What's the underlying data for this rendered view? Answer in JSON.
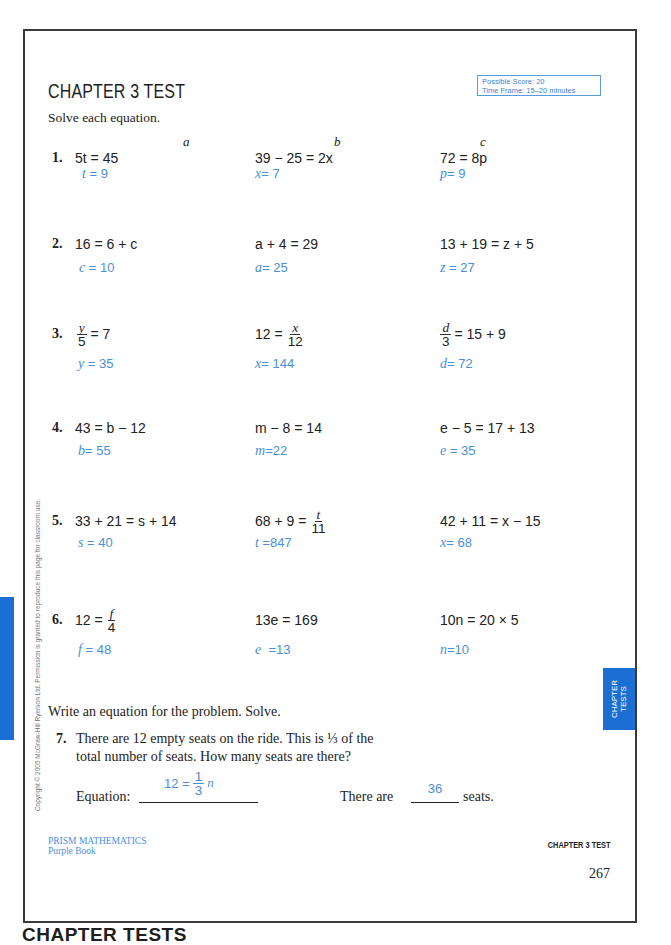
{
  "header": {
    "title": "CHAPTER 3 TEST",
    "score_box": {
      "possible_score": "Possible Score: 20",
      "time_frame": "Time Frame: 15–20 minutes"
    }
  },
  "instructions": "Solve each equation.",
  "column_labels": [
    "a",
    "b",
    "c"
  ],
  "rows": [
    {
      "number": "1.",
      "cells": [
        {
          "eq": {
            "pre": "5t = 45"
          },
          "answer": {
            "var": "t",
            "rest": " = 9"
          }
        },
        {
          "eq": {
            "pre": "39 − 25 = 2x"
          },
          "answer": {
            "var": "x",
            "rest": "= 7"
          }
        },
        {
          "eq": {
            "pre": "72 = 8p"
          },
          "answer": {
            "var": "p",
            "rest": "= 9"
          }
        }
      ]
    },
    {
      "number": "2.",
      "cells": [
        {
          "eq": {
            "pre": "16 = 6 + c"
          },
          "answer": {
            "var": "c",
            "rest": " = 10"
          }
        },
        {
          "eq": {
            "pre": "a + 4 = 29"
          },
          "answer": {
            "var": "a",
            "rest": "= 25"
          }
        },
        {
          "eq": {
            "pre": "13 + 19 = z + 5"
          },
          "answer": {
            "var": "z",
            "rest": " = 27"
          }
        }
      ]
    },
    {
      "number": "3.",
      "cells": [
        {
          "eq": {
            "pre": "",
            "num": "y",
            "den": "5",
            "post": "= 7"
          },
          "answer": {
            "var": "y",
            "rest": " = 35"
          }
        },
        {
          "eq": {
            "pre": "12 =",
            "num": "x",
            "den": "12",
            "post": ""
          },
          "answer": {
            "var": "x",
            "rest": "= 144"
          }
        },
        {
          "eq": {
            "pre": "",
            "num": "d",
            "den": "3",
            "post": "= 15 + 9"
          },
          "answer": {
            "var": "d",
            "rest": "= 72"
          }
        }
      ]
    },
    {
      "number": "4.",
      "cells": [
        {
          "eq": {
            "pre": "43 = b − 12"
          },
          "answer": {
            "var": "b",
            "rest": "= 55"
          }
        },
        {
          "eq": {
            "pre": "m − 8 = 14"
          },
          "answer": {
            "var": "m",
            "rest": "=22"
          }
        },
        {
          "eq": {
            "pre": "e − 5 = 17 + 13"
          },
          "answer": {
            "var": "e",
            "rest": " = 35"
          }
        }
      ]
    },
    {
      "number": "5.",
      "cells": [
        {
          "eq": {
            "pre": "33 + 21 = s + 14"
          },
          "answer": {
            "var": "s",
            "rest": " = 40"
          }
        },
        {
          "eq": {
            "pre": "68 + 9 =",
            "num": "t",
            "den": "11",
            "post": ""
          },
          "answer": {
            "var": "t",
            "rest": " =847"
          }
        },
        {
          "eq": {
            "pre": "42 + 11 = x − 15"
          },
          "answer": {
            "var": "x",
            "rest": "= 68"
          }
        }
      ]
    },
    {
      "number": "6.",
      "cells": [
        {
          "eq": {
            "pre": "12 =",
            "num": "f",
            "den": "4",
            "post": ""
          },
          "answer": {
            "var": "f",
            "rest": " = 48"
          }
        },
        {
          "eq": {
            "pre": "13e = 169"
          },
          "answer": {
            "var": "e",
            "rest": "  =13"
          }
        },
        {
          "eq": {
            "pre": "10n = 20 × 5"
          },
          "answer": {
            "var": "n",
            "rest": "=10"
          }
        }
      ]
    }
  ],
  "word_problem": {
    "instructions": "Write an equation for the problem. Solve.",
    "number": "7.",
    "line1": "There are 12 empty seats on the ride. This is ⅓ of the",
    "line2": "total number of seats. How many seats are there?",
    "equation_label": "Equation:",
    "equation_answer": {
      "pre": "12 =",
      "num": "1",
      "den": "3",
      "var": "n"
    },
    "there_are_label": "There are",
    "seats_answer": "36",
    "seats_label": "seats."
  },
  "footer": {
    "series": "PRISM MATHEMATICS",
    "book": "Purple Book",
    "chapter": "CHAPTER 3 TEST",
    "page_number": "267"
  },
  "side_tab": {
    "line1": "CHAPTER",
    "line2": "TESTS"
  },
  "copyright": "Copyright © 2005 McGraw-Hill Ryerson Ltd. Permission is granted to reproduce this page for classroom use.",
  "bottom_label": "CHAPTER TESTS",
  "colors": {
    "answer_blue": "#4a8fdc",
    "tab_blue": "#1b6fd2",
    "border": "#3a3a3a"
  }
}
